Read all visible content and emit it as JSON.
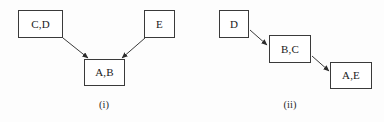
{
  "figure": {
    "background_color": "#fdfdfd",
    "stroke_color": "#3a3a3a",
    "text_color": "#1a1a1a",
    "diagrams": [
      {
        "caption": "(i)",
        "caption_x": 104,
        "caption_y": 100,
        "nodes": [
          {
            "id": "cd",
            "label": "C,D",
            "x": 18,
            "y": 10,
            "w": 45,
            "h": 28
          },
          {
            "id": "e",
            "label": "E",
            "x": 144,
            "y": 10,
            "w": 31,
            "h": 28
          },
          {
            "id": "ab",
            "label": "A,B",
            "x": 84,
            "y": 59,
            "w": 41,
            "h": 27
          }
        ],
        "edges": [
          {
            "from": "cd",
            "to": "ab",
            "x1": 63,
            "y1": 38,
            "x2": 88,
            "y2": 58
          },
          {
            "from": "e",
            "to": "ab",
            "x1": 145,
            "y1": 38,
            "x2": 122,
            "y2": 58
          }
        ]
      },
      {
        "caption": "(ii)",
        "caption_x": 290,
        "caption_y": 100,
        "nodes": [
          {
            "id": "d",
            "label": "D",
            "x": 219,
            "y": 10,
            "w": 30,
            "h": 28
          },
          {
            "id": "bc",
            "label": "B,C",
            "x": 269,
            "y": 35,
            "w": 42,
            "h": 28
          },
          {
            "id": "ae",
            "label": "A,E",
            "x": 330,
            "y": 62,
            "w": 42,
            "h": 27
          }
        ],
        "edges": [
          {
            "from": "d",
            "to": "bc",
            "x1": 250,
            "y1": 30,
            "x2": 267,
            "y2": 45
          },
          {
            "from": "bc",
            "to": "ae",
            "x1": 312,
            "y1": 56,
            "x2": 329,
            "y2": 71
          }
        ]
      }
    ]
  }
}
